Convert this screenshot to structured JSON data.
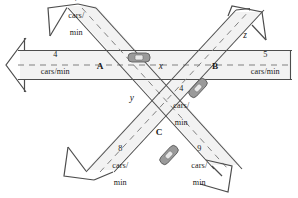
{
  "figure": {
    "unit": "cars/min"
  },
  "colors": {
    "road_fill": "#f2f2f2",
    "road_stroke": "#4d4d4d",
    "dash_stroke": "#808080",
    "car_body": "#9a9a9a",
    "car_outline": "#5f5f5f",
    "car_window": "#e8e8e8",
    "text": "#1a1a1a",
    "background": "#ffffff"
  },
  "intersections": [
    {
      "id": "A",
      "label": "A"
    },
    {
      "id": "B",
      "label": "B"
    },
    {
      "id": "C",
      "label": "C"
    }
  ],
  "flows": [
    {
      "id": "flow-top-left",
      "value": "7",
      "unit_line1": "cars/",
      "unit_line2": "min",
      "known": true
    },
    {
      "id": "flow-left",
      "value": "4",
      "unit_line1": "cars/min",
      "unit_line2": "",
      "known": true
    },
    {
      "id": "flow-right",
      "value": "5",
      "unit_line1": "cars/min",
      "unit_line2": "",
      "known": true
    },
    {
      "id": "flow-middle",
      "value": "4",
      "unit_line1": "cars/",
      "unit_line2": "min",
      "known": true
    },
    {
      "id": "flow-bottom-left",
      "value": "8",
      "unit_line1": "cars/",
      "unit_line2": "min",
      "known": true
    },
    {
      "id": "flow-bottom-right",
      "value": "9",
      "unit_line1": "cars/",
      "unit_line2": "min",
      "known": true
    }
  ],
  "unknowns": [
    {
      "id": "x",
      "label": "x",
      "segment": "between A and B on horizontal road"
    },
    {
      "id": "y",
      "label": "y",
      "segment": "between A and C on diagonal road"
    },
    {
      "id": "z",
      "label": "z",
      "segment": "upper right diagonal road above B"
    }
  ],
  "cars": [
    {
      "id": "car-horizontal",
      "orientation": "horizontal"
    },
    {
      "id": "car-upper-right-diagonal",
      "orientation": "diagonal-up-right"
    },
    {
      "id": "car-lower-right-diagonal",
      "orientation": "diagonal-down-right"
    }
  ]
}
